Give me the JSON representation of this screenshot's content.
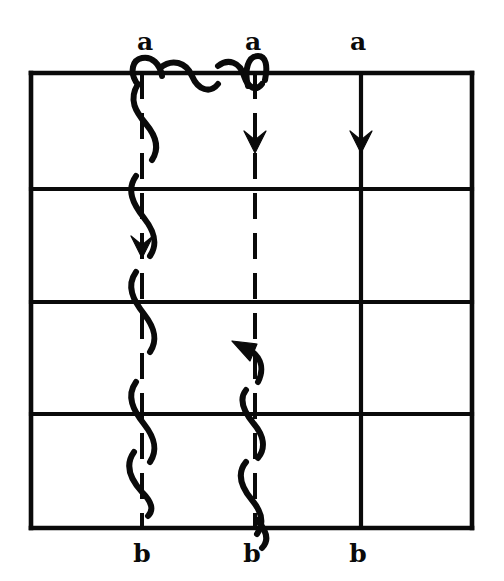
{
  "figure": {
    "background_color": "#ffffff",
    "ink_color": "#0a0a0a",
    "canvas": {
      "width": 504,
      "height": 581
    }
  },
  "grid": {
    "left": 31,
    "right": 472,
    "top": 73,
    "bottom": 528,
    "horizontal_lines_y": [
      73,
      189,
      302,
      414,
      528
    ],
    "vertical_lines_x": [
      31,
      142,
      255,
      361,
      472
    ],
    "columns": 4,
    "rows": 4,
    "solid_vertical_x": [
      31,
      361,
      472
    ],
    "dashed_vertical_x": [
      142,
      255
    ]
  },
  "top_labels": [
    {
      "text": "a",
      "x": 145,
      "y": 50
    },
    {
      "text": "a",
      "x": 253,
      "y": 50
    },
    {
      "text": "a",
      "x": 358,
      "y": 50
    }
  ],
  "bottom_labels": [
    {
      "text": "b",
      "x": 142,
      "y": 562
    },
    {
      "text": "b",
      "x": 252,
      "y": 562
    },
    {
      "text": "b",
      "x": 358,
      "y": 562
    }
  ],
  "arrows": [
    {
      "name": "arrow-down-column-1",
      "x": 142,
      "y": 250,
      "direction": "down"
    },
    {
      "name": "arrow-down-column-2",
      "x": 255,
      "y": 145,
      "direction": "down"
    },
    {
      "name": "arrow-down-column-3",
      "x": 361,
      "y": 145,
      "direction": "down"
    },
    {
      "name": "arrow-up-curved-column-2",
      "x": 238,
      "y": 345,
      "direction": "up"
    }
  ],
  "squiggles": [
    {
      "name": "squiggle-column-1",
      "winds_around_x": 142,
      "from_y": 55,
      "to_y": 500
    },
    {
      "name": "squiggle-top-connector",
      "from_x": 142,
      "to_x": 258,
      "along_y": 73
    },
    {
      "name": "squiggle-column-2",
      "winds_around_x": 255,
      "from_y": 52,
      "to_y": 560
    }
  ]
}
